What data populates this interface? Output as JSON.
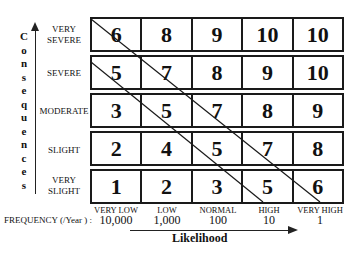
{
  "diagram": {
    "type": "risk-matrix",
    "y_axis": {
      "title": "Consequences",
      "title_letters": [
        "C",
        "o",
        "n",
        "s",
        "e",
        "q",
        "u",
        "e",
        "n",
        "c",
        "e",
        "s"
      ],
      "levels_top_to_bottom": [
        "VERY SEVERE",
        "SEVERE",
        "MODERATE",
        "SLIGHT",
        "VERY SLIGHT"
      ],
      "row_labels": [
        {
          "line1": "VERY",
          "line2": "SEVERE"
        },
        {
          "line1": "SEVERE",
          "line2": ""
        },
        {
          "line1": "MODERATE",
          "line2": ""
        },
        {
          "line1": "SLIGHT",
          "line2": ""
        },
        {
          "line1": "VERY",
          "line2": "SLIGHT"
        }
      ]
    },
    "x_axis": {
      "title": "Likelihood",
      "frequency_label": "FREQUENCY (/Year ) :",
      "columns": [
        {
          "label": "VERY LOW",
          "frequency": "10,000"
        },
        {
          "label": "LOW",
          "frequency": "1,000"
        },
        {
          "label": "NORMAL",
          "frequency": "100"
        },
        {
          "label": "HIGH",
          "frequency": "10"
        },
        {
          "label": "VERY HIGH",
          "frequency": "1"
        }
      ]
    },
    "matrix": [
      [
        "6",
        "8",
        "9",
        "10",
        "10"
      ],
      [
        "5",
        "7",
        "8",
        "9",
        "10"
      ],
      [
        "3",
        "5",
        "7",
        "8",
        "9"
      ],
      [
        "2",
        "4",
        "5",
        "7",
        "8"
      ],
      [
        "1",
        "2",
        "3",
        "5",
        "6"
      ]
    ],
    "diagonal_lines": 2,
    "colors": {
      "line": "#1a1a1a",
      "background": "#ffffff"
    }
  }
}
